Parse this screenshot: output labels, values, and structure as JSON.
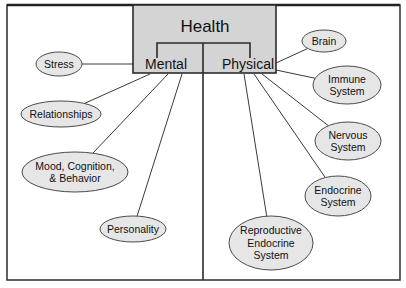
{
  "diagram": {
    "title": "Health",
    "branches": [
      {
        "label": "Mental",
        "nodes": [
          {
            "id": "stress",
            "lines": [
              "Stress"
            ]
          },
          {
            "id": "relationships",
            "lines": [
              "Relationships"
            ]
          },
          {
            "id": "mood",
            "lines": [
              "Mood, Cognition,",
              "& Behavior"
            ]
          },
          {
            "id": "personality",
            "lines": [
              "Personality"
            ]
          }
        ]
      },
      {
        "label": "Physical",
        "nodes": [
          {
            "id": "brain",
            "lines": [
              "Brain"
            ]
          },
          {
            "id": "immune",
            "lines": [
              "Immune",
              "System"
            ]
          },
          {
            "id": "nervous",
            "lines": [
              "Nervous",
              "System"
            ]
          },
          {
            "id": "endocrine",
            "lines": [
              "Endocrine",
              "System"
            ]
          },
          {
            "id": "reproductive",
            "lines": [
              "Reproductive",
              "Endocrine",
              "System"
            ]
          }
        ]
      }
    ]
  }
}
